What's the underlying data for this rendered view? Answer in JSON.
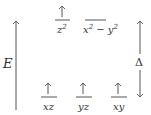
{
  "diagram": {
    "type": "crystal-field-splitting",
    "axis_label": "E",
    "gap_label": "Δ",
    "upper_levels": [
      {
        "name": "z2",
        "base": "z",
        "sup": "2",
        "electrons": 1
      },
      {
        "name": "x2-y2",
        "base": "x",
        "sup": "2",
        "mid": " − y",
        "sup2": "2",
        "electrons": 0
      }
    ],
    "lower_levels": [
      {
        "name": "xz",
        "label": "xz",
        "electrons": 1
      },
      {
        "name": "yz",
        "label": "yz",
        "electrons": 1
      },
      {
        "name": "xy",
        "label": "xy",
        "electrons": 1
      }
    ],
    "colors": {
      "line": "#555555",
      "text": "#333333"
    }
  }
}
